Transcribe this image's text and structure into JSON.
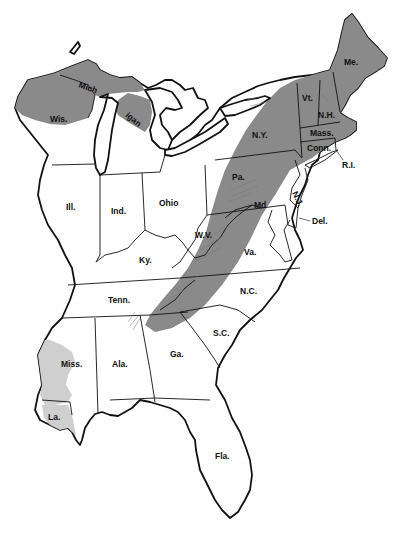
{
  "map": {
    "region": "Eastern United States",
    "shading": {
      "dark": "#8a8a8a",
      "light": "#cfcfcf",
      "outline": "#111111",
      "background": "#ffffff"
    },
    "states": [
      {
        "id": "wis",
        "label": "Wis.",
        "shading": "dark-north"
      },
      {
        "id": "mich-up",
        "label": "Mich",
        "shading": "dark"
      },
      {
        "id": "mich-lp",
        "label": "igan",
        "shading": "dark-north"
      },
      {
        "id": "ill",
        "label": "Ill.",
        "shading": "none"
      },
      {
        "id": "ind",
        "label": "Ind.",
        "shading": "none"
      },
      {
        "id": "ohio",
        "label": "Ohio",
        "shading": "none"
      },
      {
        "id": "ky",
        "label": "Ky.",
        "shading": "partial-east"
      },
      {
        "id": "tenn",
        "label": "Tenn.",
        "shading": "partial-east"
      },
      {
        "id": "miss",
        "label": "Miss.",
        "shading": "light-west"
      },
      {
        "id": "la",
        "label": "La.",
        "shading": "light"
      },
      {
        "id": "ala",
        "label": "Ala.",
        "shading": "none"
      },
      {
        "id": "ga",
        "label": "Ga.",
        "shading": "partial-north"
      },
      {
        "id": "fla",
        "label": "Fla.",
        "shading": "none"
      },
      {
        "id": "sc",
        "label": "S.C.",
        "shading": "none"
      },
      {
        "id": "nc",
        "label": "N.C.",
        "shading": "partial-west"
      },
      {
        "id": "va",
        "label": "Va.",
        "shading": "partial-west"
      },
      {
        "id": "wv",
        "label": "W.V.",
        "shading": "partial"
      },
      {
        "id": "md",
        "label": "Md",
        "shading": "partial"
      },
      {
        "id": "del",
        "label": "Del.",
        "shading": "none"
      },
      {
        "id": "nj",
        "label": "N.J.",
        "shading": "none"
      },
      {
        "id": "pa",
        "label": "Pa.",
        "shading": "dark-band"
      },
      {
        "id": "ny",
        "label": "N.Y.",
        "shading": "dark"
      },
      {
        "id": "vt",
        "label": "Vt.",
        "shading": "dark"
      },
      {
        "id": "nh",
        "label": "N.H.",
        "shading": "dark"
      },
      {
        "id": "me",
        "label": "Me.",
        "shading": "dark"
      },
      {
        "id": "mass",
        "label": "Mass.",
        "shading": "dark"
      },
      {
        "id": "conn",
        "label": "Conn.",
        "shading": "dark"
      },
      {
        "id": "ri",
        "label": "R.I.",
        "shading": "dark"
      }
    ]
  }
}
